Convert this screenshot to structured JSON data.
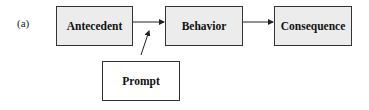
{
  "figure": {
    "panel_label": "(a)",
    "nodes": [
      {
        "id": "antecedent",
        "label": "Antecedent"
      },
      {
        "id": "behavior",
        "label": "Behavior"
      },
      {
        "id": "consequence",
        "label": "Consequence"
      },
      {
        "id": "prompt",
        "label": "Prompt"
      }
    ],
    "edges": [
      {
        "from": "antecedent",
        "to": "behavior"
      },
      {
        "from": "behavior",
        "to": "consequence"
      },
      {
        "from": "prompt",
        "to": "antecedent-behavior-link"
      }
    ],
    "colors": {
      "shaded_fill": "#ececec",
      "border": "#333333"
    }
  }
}
